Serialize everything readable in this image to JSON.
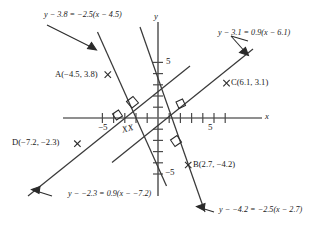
{
  "figure": {
    "type": "coordinate-geometry-diagram",
    "background_color": "#ffffff",
    "line_color": "#3a3a3a",
    "axis_color": "#555555",
    "text_color": "#1a1a1a"
  },
  "axes": {
    "x_label": "x",
    "y_label": "y",
    "x_tick_label": "5",
    "x_tick_label_negative": "−5",
    "y_tick_label": "5",
    "y_tick_label_negative": "−5",
    "x_range": [
      -8.6,
      8.6
    ],
    "y_range": [
      -7.6,
      7.2
    ],
    "tick_spacing": 1,
    "labeled_ticks": [
      -5,
      5
    ],
    "origin_px": [
      158,
      118
    ],
    "unit_px": 11.2,
    "grid": false
  },
  "points": [
    {
      "id": "A",
      "label": "A(−4.5, 3.8)",
      "x": -4.5,
      "y": 3.8
    },
    {
      "id": "B",
      "label": "B(2.7, −4.2)",
      "x": 2.7,
      "y": -4.2
    },
    {
      "id": "C",
      "label": "C(6.1, 3.1)",
      "x": 6.1,
      "y": 3.1
    },
    {
      "id": "D",
      "label": "D(−7.2, −2.3)",
      "x": -7.2,
      "y": -2.3
    }
  ],
  "lines": [
    {
      "id": "line-A",
      "equation": "y − 3.8 = −2.5(x − 4.5)",
      "through_point": "A",
      "slope": -2.5,
      "point": [
        -4.5,
        3.8
      ]
    },
    {
      "id": "line-C",
      "equation": "y − 3.1 = 0.9(x − 6.1)",
      "through_point": "C",
      "slope": 0.9,
      "point": [
        6.1,
        3.1
      ]
    },
    {
      "id": "line-D",
      "equation": "y − −2.3 = 0.9(x − −7.2)",
      "through_point": "D",
      "slope": 0.9,
      "point": [
        -7.2,
        -2.3
      ]
    },
    {
      "id": "line-B",
      "equation": "y − −4.2 = −2.5(x − 2.7)",
      "through_point": "B",
      "slope": -2.5,
      "point": [
        2.7,
        -4.2
      ]
    }
  ],
  "annotations": {
    "xx_mark": "XX",
    "right_angle_count": 4
  }
}
